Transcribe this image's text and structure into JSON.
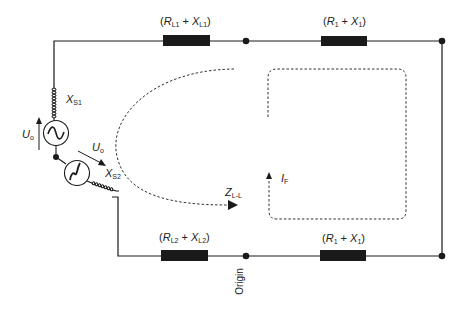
{
  "diagram": {
    "type": "circuit",
    "labels": {
      "top_left_impedance": {
        "paren_open": "(",
        "r": "R",
        "r_sub": "L1",
        "plus": " + ",
        "x": "X",
        "x_sub": "L1",
        "paren_close": ")"
      },
      "top_right_impedance": {
        "paren_open": "(",
        "r": "R",
        "r_sub": "1",
        "plus": " + ",
        "x": "X",
        "x_sub": "1",
        "paren_close": ")"
      },
      "bottom_left_impedance": {
        "paren_open": "(",
        "r": "R",
        "r_sub": "L2",
        "plus": " + ",
        "x": "X",
        "x_sub": "L2",
        "paren_close": ")"
      },
      "bottom_right_impedance": {
        "paren_open": "(",
        "r": "R",
        "r_sub": "1",
        "plus": " + ",
        "x": "X",
        "x_sub": "1",
        "paren_close": ")"
      },
      "source_reactance_1": {
        "main": "X",
        "sub": "S1"
      },
      "source_reactance_2": {
        "main": "X",
        "sub": "S2"
      },
      "voltage_1": {
        "main": "U",
        "sub": "o"
      },
      "voltage_2": {
        "main": "U",
        "sub": "o"
      },
      "loop_impedance": {
        "main": "Z",
        "sub": "L-L"
      },
      "fault_current": {
        "main": "I",
        "sub": "F"
      },
      "origin": "Origin"
    },
    "colors": {
      "line": "#1a1a1a",
      "background": "#ffffff"
    }
  }
}
